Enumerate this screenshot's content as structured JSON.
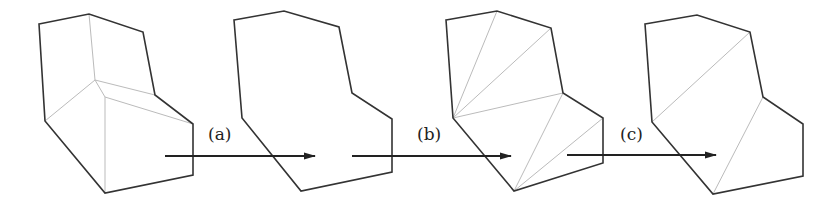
{
  "figure": {
    "stages": [
      {
        "name": "initial-polygon-with-interior-vertices",
        "outline": [
          [
            39,
            24
          ],
          [
            89,
            14
          ],
          [
            143,
            32
          ],
          [
            155,
            95
          ],
          [
            193,
            124
          ],
          [
            193,
            175
          ],
          [
            105,
            193
          ],
          [
            45,
            121
          ]
        ],
        "inner_edges": [
          [
            [
              89,
              14
            ],
            [
              95,
              80
            ]
          ],
          [
            [
              95,
              80
            ],
            [
              45,
              121
            ]
          ],
          [
            [
              95,
              80
            ],
            [
              155,
              95
            ]
          ],
          [
            [
              95,
              80
            ],
            [
              105,
              97
            ]
          ],
          [
            [
              105,
              97
            ],
            [
              193,
              124
            ]
          ],
          [
            [
              105,
              97
            ],
            [
              105,
              193
            ]
          ]
        ]
      },
      {
        "name": "polygon-outline",
        "outline": [
          [
            234,
            20
          ],
          [
            284,
            11
          ],
          [
            339,
            27
          ],
          [
            352,
            93
          ],
          [
            392,
            119
          ],
          [
            392,
            172
          ],
          [
            301,
            191
          ],
          [
            242,
            118
          ]
        ],
        "inner_edges": []
      },
      {
        "name": "triangulated-polygon",
        "outline": [
          [
            446,
            20
          ],
          [
            497,
            11
          ],
          [
            551,
            28
          ],
          [
            563,
            93
          ],
          [
            603,
            118
          ],
          [
            603,
            163
          ],
          [
            514,
            191
          ],
          [
            453,
            118
          ]
        ],
        "inner_edges": [
          [
            [
              497,
              11
            ],
            [
              453,
              118
            ]
          ],
          [
            [
              551,
              28
            ],
            [
              453,
              118
            ]
          ],
          [
            [
              563,
              93
            ],
            [
              453,
              118
            ]
          ],
          [
            [
              563,
              93
            ],
            [
              514,
              191
            ]
          ],
          [
            [
              603,
              118
            ],
            [
              514,
              191
            ]
          ]
        ]
      },
      {
        "name": "reduced-triangulation",
        "outline": [
          [
            645,
            24
          ],
          [
            697,
            15
          ],
          [
            750,
            32
          ],
          [
            763,
            97
          ],
          [
            803,
            124
          ],
          [
            803,
            176
          ],
          [
            713,
            194
          ],
          [
            652,
            122
          ]
        ],
        "inner_edges": [
          [
            [
              750,
              32
            ],
            [
              652,
              122
            ]
          ],
          [
            [
              763,
              97
            ],
            [
              713,
              194
            ]
          ]
        ]
      }
    ],
    "arrows": [
      {
        "label": "(a)",
        "x1": 165,
        "x2": 315,
        "y": 156,
        "label_x": 208,
        "label_y": 127
      },
      {
        "label": "(b)",
        "x1": 352,
        "x2": 511,
        "y": 156,
        "label_x": 417,
        "label_y": 127
      },
      {
        "label": "(c)",
        "x1": 567,
        "x2": 716,
        "y": 155,
        "label_x": 620,
        "label_y": 127
      }
    ]
  },
  "labels": {
    "a": "(a)",
    "b": "(b)",
    "c": "(c)"
  }
}
